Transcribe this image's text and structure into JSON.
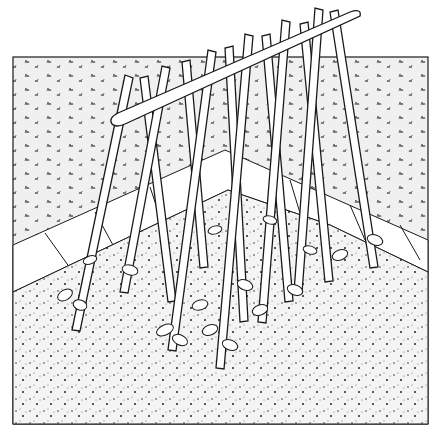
{
  "illustration": {
    "subject": "bean pole A-frame trellis with climbing plants",
    "style": "black and white line drawing",
    "colors": {
      "ink": "#1a1a1a",
      "paper": "#ffffff",
      "ground": "#f2f2f2"
    },
    "frame": {
      "x": 13,
      "y": 57,
      "w": 415,
      "h": 367
    },
    "horizon_y": 57,
    "ridge": {
      "x1": 112,
      "y1": 124,
      "x2": 355,
      "y2": 17
    },
    "pole_pairs": [
      {
        "top": [
          130,
          82
        ],
        "left": [
          78,
          328
        ],
        "right": [
          165,
          300
        ]
      },
      {
        "top": [
          168,
          70
        ],
        "left": [
          125,
          290
        ],
        "right": [
          200,
          265
        ]
      },
      {
        "top": [
          212,
          52
        ],
        "left": [
          170,
          345
        ],
        "right": [
          240,
          320
        ]
      },
      {
        "top": [
          248,
          38
        ],
        "left": [
          218,
          365
        ],
        "right": [
          285,
          300
        ]
      },
      {
        "top": [
          285,
          24
        ],
        "left": [
          260,
          320
        ],
        "right": [
          325,
          280
        ]
      },
      {
        "top": [
          318,
          12
        ],
        "left": [
          295,
          290
        ],
        "right": [
          370,
          265
        ]
      }
    ],
    "paving": {
      "points": "13,245 230,152 428,245 428,270 330,225 230,188 13,290"
    }
  }
}
